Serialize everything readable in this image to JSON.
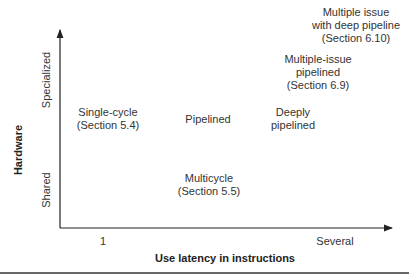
{
  "diagram": {
    "x_axis": {
      "title": "Use latency in instructions",
      "ticks": [
        "1",
        "Several"
      ]
    },
    "y_axis": {
      "title": "Hardware",
      "ticks": [
        "Shared",
        "Specialized"
      ]
    },
    "nodes": [
      {
        "id": "single-cycle",
        "lines": [
          "Single-cycle",
          "(Section 5.4)"
        ]
      },
      {
        "id": "pipelined",
        "lines": [
          "Pipelined"
        ]
      },
      {
        "id": "deeply-pipelined",
        "lines": [
          "Deeply",
          "pipelined"
        ]
      },
      {
        "id": "multiple-issue-pipelined",
        "lines": [
          "Multiple-issue",
          "pipelined",
          "(Section 6.9)"
        ]
      },
      {
        "id": "multiple-issue-deep",
        "lines": [
          "Multiple issue",
          "with deep pipeline",
          "(Section 6.10)"
        ]
      },
      {
        "id": "multicycle",
        "lines": [
          "Multicycle",
          "(Section 5.5)"
        ]
      }
    ],
    "colors": {
      "axis": "#222222",
      "text": "#333333",
      "background": "#ffffff"
    }
  }
}
